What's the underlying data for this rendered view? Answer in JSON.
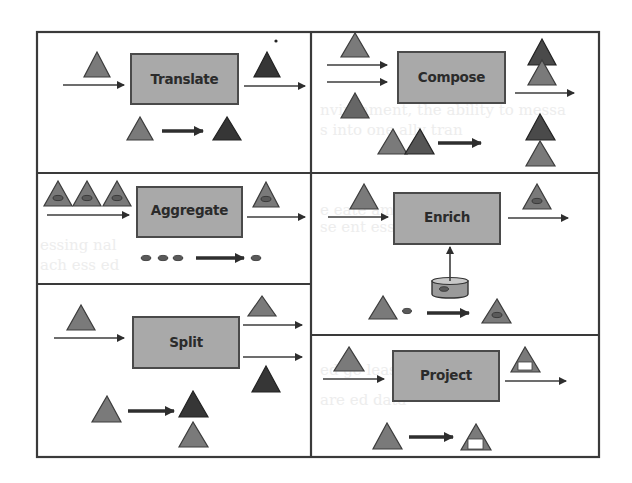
{
  "diagram": {
    "colors": {
      "box_fill": "#a9a9a9",
      "triangle_light": "#7a7a7a",
      "triangle_dark": "#363636",
      "line": "#3a3a3a"
    },
    "panels": [
      {
        "id": "translate",
        "label": "Translate",
        "position": "top-left",
        "description": "Light triangle translated into dark triangle"
      },
      {
        "id": "compose",
        "label": "Compose",
        "position": "top-right",
        "description": "Two triangles composed into a stacked pair"
      },
      {
        "id": "aggregate",
        "label": "Aggregate",
        "position": "middle-left",
        "description": "Three triangles with ovals aggregated into one triangle with an oval"
      },
      {
        "id": "enrich",
        "label": "Enrich",
        "position": "middle-right",
        "description": "Triangle enriched with oval from a data store"
      },
      {
        "id": "split",
        "label": "Split",
        "position": "bottom-left",
        "description": "Triangle split into a light and a dark triangle"
      },
      {
        "id": "project",
        "label": "Project",
        "position": "bottom-right",
        "description": "Triangle projected to a triangle with a white window"
      }
    ]
  }
}
